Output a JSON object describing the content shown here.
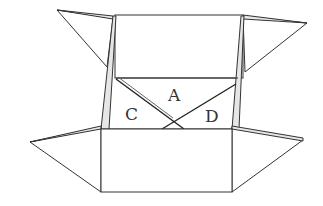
{
  "diagram": {
    "labels": {
      "a": "A",
      "c": "C",
      "d": "D"
    },
    "colors": {
      "stroke": "#333333",
      "strip_fill": "#e6e6e6",
      "background": "#ffffff"
    }
  }
}
